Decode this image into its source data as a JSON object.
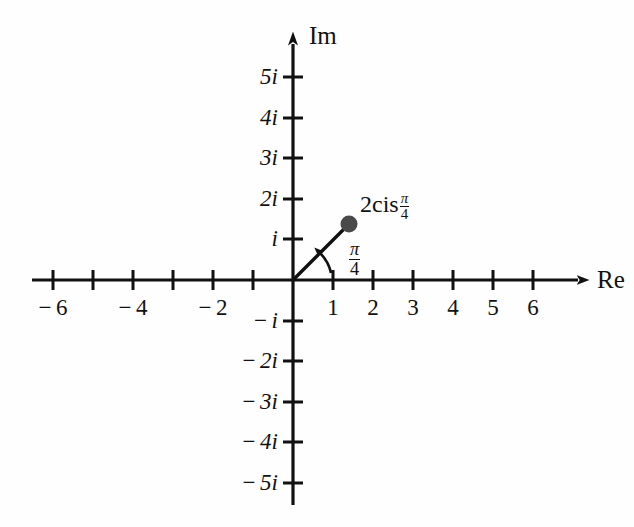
{
  "figure": {
    "background_color": "#fefefe",
    "ink_color": "#111111",
    "point_color": "#4a4a4a"
  },
  "axes": {
    "real": {
      "name": "Re",
      "arrow": "right",
      "tick_labels": [
        "-6",
        "-4",
        "-2",
        "1",
        "2",
        "3",
        "4",
        "5",
        "6"
      ],
      "range": [
        -6.6,
        7.3
      ]
    },
    "imaginary": {
      "name": "Im",
      "arrow": "up",
      "tick_labels": [
        "5i",
        "4i",
        "3i",
        "2i",
        "i",
        "-i",
        "-2i",
        "-3i",
        "-4i",
        "-5i"
      ],
      "range": [
        -5.6,
        6.1
      ]
    }
  },
  "annotations": {
    "point_label_prefix": "2cis",
    "point_label_numerator": "π",
    "point_label_denominator": "4",
    "angle_numerator": "π",
    "angle_denominator": "4"
  },
  "chart_data": {
    "type": "scatter",
    "title": "",
    "xlabel": "Re",
    "ylabel": "Im",
    "xlim": [
      -6.6,
      7.3
    ],
    "ylim": [
      -5.6,
      6.1
    ],
    "grid": false,
    "legend": null,
    "xticks": [
      -6,
      -5,
      -4,
      -3,
      -2,
      -1,
      1,
      2,
      3,
      4,
      5,
      6
    ],
    "xtick_labels": [
      "-6",
      "",
      "-4",
      "",
      "-2",
      "",
      "1",
      "2",
      "3",
      "4",
      "5",
      "6"
    ],
    "yticks": [
      5,
      4,
      3,
      2,
      1,
      -1,
      -2,
      -3,
      -4,
      -5
    ],
    "ytick_labels": [
      "5i",
      "4i",
      "3i",
      "2i",
      "i",
      "-i",
      "-2i",
      "-3i",
      "-4i",
      "-5i"
    ],
    "series": [
      {
        "name": "2cis(pi/4)",
        "type": "point",
        "x": [
          1.414
        ],
        "y": [
          1.414
        ],
        "marker": "filled-circle",
        "color": "#4a4a4a",
        "label": "2cisπ/4"
      },
      {
        "name": "modulus-ray",
        "type": "line",
        "x": [
          0,
          1.414
        ],
        "y": [
          0,
          1.414
        ],
        "color": "#111111"
      },
      {
        "name": "argument-arc",
        "type": "arc",
        "radius": 0.95,
        "start_angle_deg": 0,
        "end_angle_deg": 45,
        "label": "π/4",
        "color": "#111111"
      }
    ]
  }
}
